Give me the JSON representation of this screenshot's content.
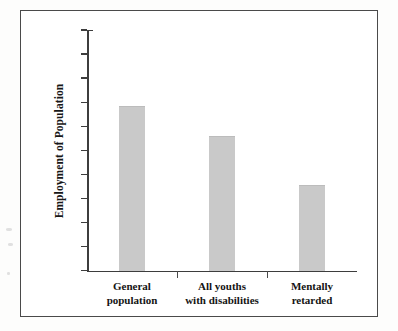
{
  "figure": {
    "background_color": "#fdfdfc",
    "frame_color": "#4a4a4a",
    "bar_color": "#c9c9c9",
    "axis_color": "#3d3d3d"
  },
  "chart_data": {
    "type": "bar",
    "title": "",
    "subtitle": "",
    "xlabel": "",
    "ylabel": "Employment of Population",
    "categories": [
      "General population",
      "All youths with disabilities",
      "Mentally retarded"
    ],
    "category_lines": [
      [
        "General",
        "population"
      ],
      [
        "All youths",
        "with disabilities"
      ],
      [
        "Mentally",
        "retarded"
      ]
    ],
    "values": [
      68.5,
      56,
      35.5
    ],
    "ylim": [
      0,
      100
    ],
    "ytick_values": [
      0,
      10,
      20,
      30,
      40,
      50,
      60,
      70,
      80,
      90,
      100
    ],
    "ytick_labels": [
      "0",
      "10",
      "20",
      "30",
      "40",
      "50",
      "60",
      "70",
      "80",
      "90",
      "100"
    ],
    "grid": false,
    "legend": null,
    "legend_position": "none"
  }
}
